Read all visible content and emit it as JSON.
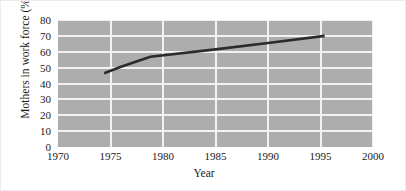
{
  "chart_data": {
    "type": "line",
    "title": "",
    "xlabel": "Year",
    "ylabel": "Mothers in work force (%)",
    "xlim": [
      1970,
      2000
    ],
    "ylim": [
      0,
      80
    ],
    "grid": true,
    "legend": "none",
    "xticks": [
      1970,
      1975,
      1980,
      1985,
      1990,
      1995,
      2000
    ],
    "xtick_labels": [
      "1970",
      "1975",
      "1980",
      "1985",
      "1990",
      "1995",
      "2000"
    ],
    "yticks": [
      0,
      10,
      20,
      30,
      40,
      50,
      60,
      70,
      80
    ],
    "ytick_labels": [
      "0",
      "10",
      "20",
      "30",
      "40",
      "50",
      "60",
      "70",
      "80"
    ],
    "series": [
      {
        "name": "Mothers in work force",
        "color": "#2b2b2b",
        "x": [
          1974.4,
          1976.0,
          1978.8,
          1985.0,
          1990.0,
          1995.4
        ],
        "values": [
          46.5,
          50.5,
          56.8,
          61.5,
          65.5,
          70.0
        ]
      }
    ],
    "plot_background": "#adadad",
    "gridline_color": "#f2f2f2",
    "axis_text_color": "#1a1a1a"
  }
}
